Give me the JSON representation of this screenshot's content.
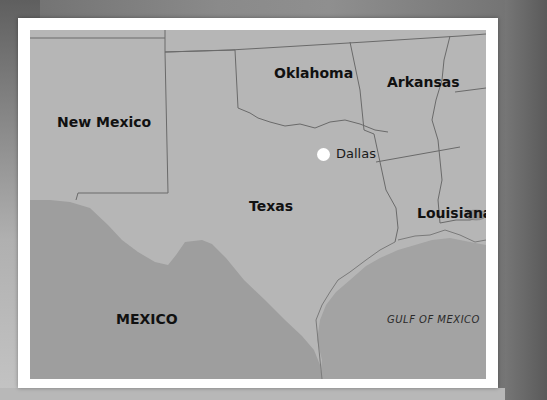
{
  "map": {
    "states": [
      {
        "name": "New Mexico"
      },
      {
        "name": "Oklahoma"
      },
      {
        "name": "Arkansas"
      },
      {
        "name": "Texas"
      },
      {
        "name": "Louisiana"
      }
    ],
    "countries": [
      {
        "name": "MEXICO"
      }
    ],
    "water_bodies": [
      {
        "name": "GULF OF MEXICO"
      }
    ],
    "cities": [
      {
        "name": "Dallas",
        "marker": "white-dot"
      }
    ],
    "colors": {
      "land": "#b4b4b4",
      "mexico": "#9c9c9c",
      "gulf": "#a2a2a2",
      "border": "#6a6a6a",
      "frame": "#ffffff",
      "city_marker": "#ffffff"
    }
  }
}
